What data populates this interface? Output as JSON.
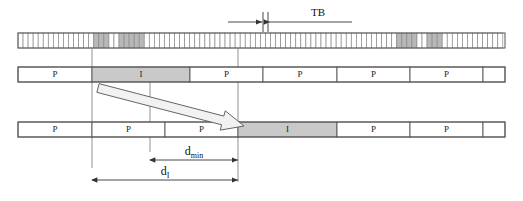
{
  "figure": {
    "type": "timing-diagram",
    "background_color": "#ffffff",
    "width": 523,
    "height": 201
  },
  "colors": {
    "outline": "#555555",
    "tick_line": "#8a8a8a",
    "shaded_cell": "#b8b8b8",
    "shaded_block": "#c9c9c9",
    "block_fill": "#ffffff",
    "dimension_line": "#333333",
    "guide_line": "#777777",
    "arrow_fill": "#f2f2f2",
    "arrow_stroke": "#555555",
    "text": "#111111"
  },
  "labels": {
    "tb": "TB",
    "d_min_main": "d",
    "d_min_sub": "min",
    "d_i_main": "d",
    "d_i_sub": "I",
    "packet": "P",
    "interference": "I"
  },
  "tick_strip": {
    "name": "time-base-strip",
    "x_start": 18,
    "x_end": 505,
    "y_top": 33,
    "y_bottom": 48,
    "cell_width": 5.05,
    "cell_count": 96,
    "shaded_cell_indices": [
      15,
      16,
      17,
      20,
      21,
      22,
      23,
      24,
      75,
      76,
      77,
      78,
      81,
      82,
      83
    ]
  },
  "tb_marker": {
    "name": "tb-dimension",
    "center_x": 265,
    "y": 22,
    "left_arrow_x": 228,
    "right_arrow_x": 300,
    "tick_left_x": 263,
    "tick_right_x": 268,
    "tick_y_top": 12,
    "tick_y_bottom": 32,
    "label_x": 318,
    "label_y": 16
  },
  "middle_row": {
    "name": "transmitter-frame-row",
    "y_top": 67,
    "y_bottom": 82,
    "x_start": 18,
    "x_end": 505,
    "blocks": [
      {
        "label": "P",
        "x0": 18,
        "x1": 92,
        "shaded": false
      },
      {
        "label": "I",
        "x0": 92,
        "x1": 190,
        "shaded": true
      },
      {
        "label": "P",
        "x0": 190,
        "x1": 263,
        "shaded": false
      },
      {
        "label": "P",
        "x0": 263,
        "x1": 337,
        "shaded": false
      },
      {
        "label": "P",
        "x0": 337,
        "x1": 410,
        "shaded": false
      },
      {
        "label": "P",
        "x0": 410,
        "x1": 483,
        "shaded": false
      },
      {
        "label": "",
        "x0": 483,
        "x1": 505,
        "shaded": false
      }
    ]
  },
  "bottom_row": {
    "name": "receiver-frame-row",
    "y_top": 122,
    "y_bottom": 137,
    "x_start": 18,
    "x_end": 505,
    "blocks": [
      {
        "label": "P",
        "x0": 18,
        "x1": 92,
        "shaded": false
      },
      {
        "label": "P",
        "x0": 92,
        "x1": 165,
        "shaded": false
      },
      {
        "label": "P",
        "x0": 165,
        "x1": 238,
        "shaded": false
      },
      {
        "label": "I",
        "x0": 238,
        "x1": 337,
        "shaded": true
      },
      {
        "label": "P",
        "x0": 337,
        "x1": 410,
        "shaded": false
      },
      {
        "label": "P",
        "x0": 410,
        "x1": 483,
        "shaded": false
      },
      {
        "label": "",
        "x0": 483,
        "x1": 505,
        "shaded": false
      }
    ]
  },
  "guide_lines": [
    {
      "name": "guide-line-left",
      "x": 92,
      "y0": 48,
      "y1": 168
    },
    {
      "name": "guide-line-middle",
      "x": 150,
      "y0": 137,
      "y1": 152
    },
    {
      "name": "guide-line-mid-top",
      "x": 150,
      "y0": 82,
      "y1": 122
    },
    {
      "name": "guide-line-right",
      "x": 238,
      "y0": 48,
      "y1": 182
    }
  ],
  "big_arrow": {
    "name": "delay-shift-arrow",
    "tail_x": 98,
    "tail_y": 88,
    "head_x": 244,
    "head_y": 126,
    "thickness": 9,
    "head_length": 22,
    "head_width": 20
  },
  "dimensions": [
    {
      "name": "d-min-dimension",
      "label_main": "d",
      "label_sub": "min",
      "x0": 150,
      "x1": 238,
      "y": 160,
      "label_x": 194,
      "label_y": 155
    },
    {
      "name": "d-i-dimension",
      "label_main": "d",
      "label_sub": "I",
      "x0": 92,
      "x1": 238,
      "y": 180,
      "label_x": 165,
      "label_y": 175
    }
  ]
}
